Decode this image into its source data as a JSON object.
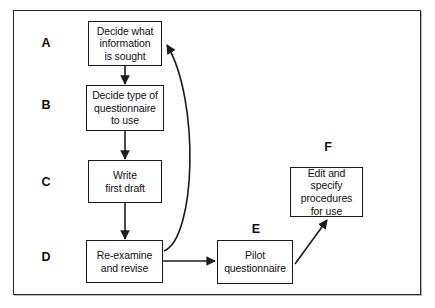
{
  "diagram": {
    "type": "flowchart",
    "background_color": "#ffffff",
    "border_color": "#2a2a2a",
    "line_color": "#1a1a1a",
    "nodes": [
      {
        "letter": "A",
        "text": "Decide what\ninformation\nis sought"
      },
      {
        "letter": "B",
        "text": "Decide type of\nquestionnaire\nto use"
      },
      {
        "letter": "C",
        "text": "Write\nfirst draft"
      },
      {
        "letter": "D",
        "text": "Re-examine\nand revise"
      },
      {
        "letter": "E",
        "text": "Pilot\nquestionnaire"
      },
      {
        "letter": "F",
        "text": "Edit and\nspecify\nprocedures\nfor use"
      }
    ],
    "edges": [
      {
        "from": "A",
        "to": "B",
        "style": "straight-down-arrow"
      },
      {
        "from": "B",
        "to": "C",
        "style": "straight-down-arrow"
      },
      {
        "from": "C",
        "to": "D",
        "style": "straight-down-arrow"
      },
      {
        "from": "D",
        "to": "E",
        "style": "straight-right-arrow"
      },
      {
        "from": "E",
        "to": "F",
        "style": "diagonal-up-right-arrow"
      },
      {
        "from": "D",
        "to": "A",
        "style": "curved-feedback-arrow"
      }
    ]
  }
}
